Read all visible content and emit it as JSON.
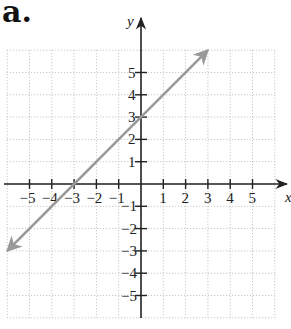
{
  "panel_label": "a.",
  "chart_data": {
    "type": "line",
    "title": "",
    "xlabel": "x",
    "ylabel": "y",
    "xlim": [
      -6,
      6
    ],
    "ylim": [
      -6,
      6
    ],
    "grid": true,
    "grid_style": "dotted",
    "x_ticks": [
      -5,
      -4,
      -3,
      -2,
      -1,
      1,
      2,
      3,
      4,
      5
    ],
    "y_ticks": [
      -5,
      -4,
      -3,
      -2,
      -1,
      1,
      2,
      3,
      4,
      5
    ],
    "x_tick_labels": [
      "−5",
      "−4",
      "−3",
      "−2",
      "−1",
      "1",
      "2",
      "3",
      "4",
      "5"
    ],
    "y_tick_labels": [
      "−5",
      "−4",
      "−3",
      "−2",
      "−1",
      "1",
      "2",
      "3",
      "4",
      "5"
    ],
    "series": [
      {
        "name": "y = x + 3",
        "equation": "y = x + 3",
        "x": [
          -6,
          3
        ],
        "y": [
          -3,
          6
        ],
        "color": "#999999",
        "arrows": "both"
      }
    ],
    "intercepts": {
      "x_intercept": [
        -3,
        0
      ],
      "y_intercept": [
        0,
        3
      ]
    }
  }
}
